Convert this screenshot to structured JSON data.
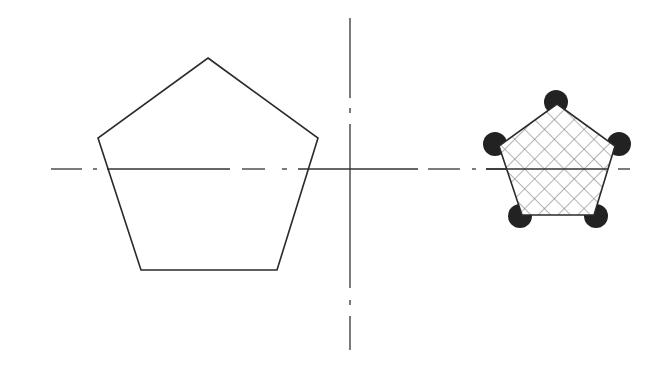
{
  "diagram": {
    "colors": {
      "background": "#ffffff",
      "stroke": "#2a2a2a",
      "hatch": "#6a6a6a",
      "circle_fill": "#222222"
    },
    "large_pentagon": {
      "points": [
        [
          208,
          58
        ],
        [
          318,
          138
        ],
        [
          277,
          270
        ],
        [
          141,
          270
        ],
        [
          98,
          138
        ]
      ]
    },
    "small_pentagon": {
      "points": [
        [
          557,
          104
        ],
        [
          615,
          146
        ],
        [
          594,
          215
        ],
        [
          522,
          215
        ],
        [
          499,
          146
        ]
      ],
      "hatch": "cross-hatch"
    },
    "vertex_circles": {
      "radius": 12,
      "centers": [
        [
          556,
          101
        ],
        [
          620,
          143
        ],
        [
          596,
          217
        ],
        [
          520,
          217
        ],
        [
          494,
          143
        ]
      ]
    },
    "horizontal_centerline": {
      "y": 169,
      "x_start": 51,
      "x_end": 630,
      "pattern": "dash-dot"
    },
    "vertical_centerline": {
      "x": 350,
      "y_start": 18,
      "y_end": 350,
      "pattern": "dash-dot"
    }
  }
}
